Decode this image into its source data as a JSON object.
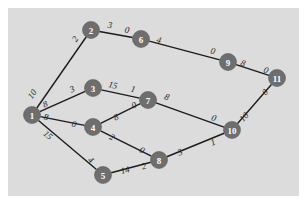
{
  "diagram": {
    "background_color": "#ffffff",
    "panel_color": "#dcdcdc",
    "node_color": "#6e6e6e",
    "node_text_color": "#ffffff",
    "edge_color": "#1c1c1c",
    "label_color": "#232323"
  },
  "chart_data": {
    "type": "diagram",
    "nodes": [
      {
        "id": "1",
        "label": "1",
        "x": 32,
        "y": 115
      },
      {
        "id": "2",
        "label": "2",
        "x": 91,
        "y": 30
      },
      {
        "id": "3",
        "label": "3",
        "x": 93,
        "y": 88
      },
      {
        "id": "4",
        "label": "4",
        "x": 93,
        "y": 127
      },
      {
        "id": "5",
        "label": "5",
        "x": 103,
        "y": 175
      },
      {
        "id": "6",
        "label": "6",
        "x": 141,
        "y": 39
      },
      {
        "id": "7",
        "label": "7",
        "x": 148,
        "y": 100
      },
      {
        "id": "8",
        "label": "8",
        "x": 159,
        "y": 160
      },
      {
        "id": "9",
        "label": "9",
        "x": 228,
        "y": 62
      },
      {
        "id": "10",
        "label": "10",
        "x": 232,
        "y": 130
      },
      {
        "id": "11",
        "label": "11",
        "x": 277,
        "y": 78
      }
    ],
    "edges": [
      {
        "from": "1",
        "to": "2",
        "tail_label": "10",
        "head_label": "2",
        "tail_x": 32,
        "tail_y": 94,
        "head_x": 75,
        "head_y": 39
      },
      {
        "from": "2",
        "to": "6",
        "tail_label": "3",
        "head_label": "0",
        "tail_x": 110,
        "tail_y": 25,
        "head_x": 127,
        "head_y": 30
      },
      {
        "from": "6",
        "to": "9",
        "tail_label": "4",
        "head_label": "0",
        "tail_x": 159,
        "tail_y": 40,
        "head_x": 213,
        "head_y": 51
      },
      {
        "from": "9",
        "to": "11",
        "tail_label": "8",
        "head_label": "0",
        "tail_x": 243,
        "tail_y": 63,
        "head_x": 266,
        "head_y": 70
      },
      {
        "from": "1",
        "to": "3",
        "tail_label": "8",
        "head_label": "3",
        "tail_x": 45,
        "tail_y": 104,
        "head_x": 72,
        "head_y": 89
      },
      {
        "from": "3",
        "to": "7",
        "tail_label": "15",
        "head_label": "1",
        "tail_x": 113,
        "tail_y": 85,
        "head_x": 133,
        "head_y": 89
      },
      {
        "from": "1",
        "to": "4",
        "tail_label": "8",
        "head_label": "0",
        "tail_x": 46,
        "tail_y": 117,
        "head_x": 74,
        "head_y": 124
      },
      {
        "from": "4",
        "to": "7",
        "tail_label": "8",
        "head_label": "0",
        "tail_x": 116,
        "tail_y": 117,
        "head_x": 134,
        "head_y": 105
      },
      {
        "from": "7",
        "to": "10",
        "tail_label": "8",
        "head_label": "0",
        "tail_x": 167,
        "tail_y": 97,
        "head_x": 214,
        "head_y": 118
      },
      {
        "from": "1",
        "to": "5",
        "tail_label": "15",
        "head_label": "4",
        "tail_x": 48,
        "tail_y": 135,
        "head_x": 91,
        "head_y": 160
      },
      {
        "from": "4",
        "to": "8",
        "tail_label": "2",
        "head_label": "0",
        "tail_x": 112,
        "tail_y": 137,
        "head_x": 142,
        "head_y": 150
      },
      {
        "from": "5",
        "to": "8",
        "tail_label": "14",
        "head_label": "2",
        "tail_x": 125,
        "tail_y": 170,
        "head_x": 144,
        "head_y": 166
      },
      {
        "from": "8",
        "to": "10",
        "tail_label": "3",
        "head_label": "1",
        "tail_x": 180,
        "tail_y": 152,
        "head_x": 213,
        "head_y": 142
      },
      {
        "from": "10",
        "to": "11",
        "tail_label": "10",
        "head_label": "0",
        "tail_x": 244,
        "tail_y": 117,
        "head_x": 265,
        "head_y": 92
      }
    ],
    "title": "",
    "xlabel": "",
    "ylabel": ""
  }
}
